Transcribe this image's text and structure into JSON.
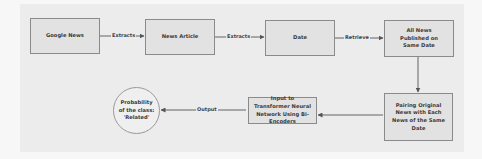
{
  "diagram": {
    "nodes": {
      "google_news": {
        "label": "Google News",
        "shape": "rectangle"
      },
      "news_article": {
        "label": "News Article",
        "shape": "rectangle"
      },
      "date": {
        "label": "Date",
        "shape": "rectangle"
      },
      "all_news": {
        "label": "All News Published on Same Date",
        "shape": "rectangle"
      },
      "pairing": {
        "label": "Pairing Original News with Each News of the Same Date",
        "shape": "rectangle"
      },
      "transformer": {
        "label": "Input to Transformer Neural Network Using Bi-Encoders",
        "shape": "rectangle"
      },
      "probability": {
        "label": "Probability of the class: 'Related'",
        "shape": "circle"
      }
    },
    "edges": [
      {
        "from": "google_news",
        "to": "news_article",
        "label": "Extracts"
      },
      {
        "from": "news_article",
        "to": "date",
        "label": "Extracts"
      },
      {
        "from": "date",
        "to": "all_news",
        "label": "Retrieve"
      },
      {
        "from": "all_news",
        "to": "pairing",
        "label": ""
      },
      {
        "from": "pairing",
        "to": "transformer",
        "label": ""
      },
      {
        "from": "transformer",
        "to": "probability",
        "label": "Output"
      }
    ],
    "colors": {
      "box_fill": "#e2e2e2",
      "box_border": "#8a8a8a",
      "line": "#555555",
      "background": "#ececec"
    }
  }
}
